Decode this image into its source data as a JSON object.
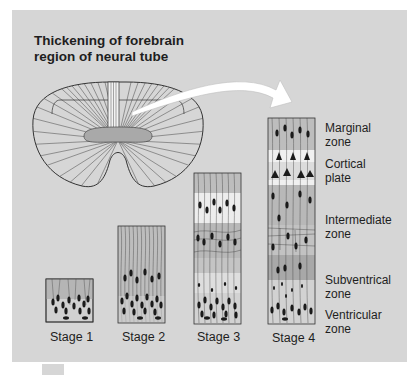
{
  "title": {
    "line1": "Thickening of forebrain",
    "line2": "region of neural tube"
  },
  "stages": [
    {
      "label": "Stage 1"
    },
    {
      "label": "Stage 2"
    },
    {
      "label": "Stage 3"
    },
    {
      "label": "Stage 4"
    }
  ],
  "zones": [
    {
      "line1": "Marginal",
      "line2": "zone"
    },
    {
      "line1": "Cortical",
      "line2": "plate"
    },
    {
      "line1": "Intermediate",
      "line2": "zone"
    },
    {
      "line1": "Subventrical",
      "line2": "zone"
    },
    {
      "line1": "Ventricular",
      "line2": "zone"
    }
  ],
  "colors": {
    "background": "#d6d6d6",
    "ventricle": "#a9a9a9",
    "light_band": "#ececec",
    "cell": "#1a1a1a",
    "outline": "#3a3a3a"
  }
}
